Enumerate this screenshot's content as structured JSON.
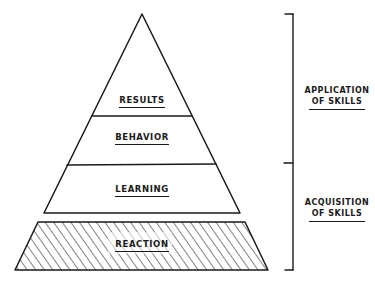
{
  "diagram": {
    "type": "pyramid",
    "levels": [
      {
        "label": "RESULTS",
        "position": "top"
      },
      {
        "label": "BEHAVIOR",
        "position": "second"
      },
      {
        "label": "LEARNING",
        "position": "third"
      },
      {
        "label": "REACTION",
        "position": "base",
        "fill": "hatched"
      }
    ],
    "groups": [
      {
        "line1": "APPLICATION",
        "line2": "OF SKILLS",
        "spans": [
          "RESULTS",
          "BEHAVIOR"
        ]
      },
      {
        "line1": "ACQUISITION",
        "line2": "OF SKILLS",
        "spans": [
          "LEARNING",
          "REACTION"
        ]
      }
    ],
    "colors": {
      "stroke": "#1a1a1a",
      "background": "#ffffff"
    }
  }
}
